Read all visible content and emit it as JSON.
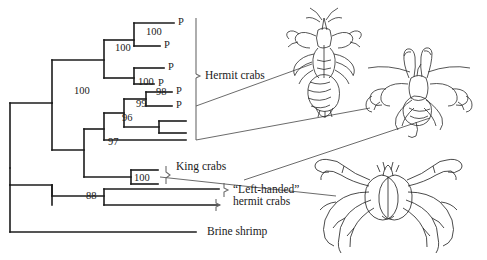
{
  "figure": {
    "type": "phylogenetic-tree",
    "title": ""
  },
  "tree": {
    "bootstrap_values": [
      {
        "id": "b-root-100",
        "value": "100",
        "x": 74,
        "y": 91
      },
      {
        "id": "b-clade-100a",
        "value": "100",
        "x": 115,
        "y": 48
      },
      {
        "id": "b-clade-100b",
        "value": "100",
        "x": 146,
        "y": 32
      },
      {
        "id": "b-clade-100c",
        "value": "100",
        "x": 140,
        "y": 82
      },
      {
        "id": "b-clade-98",
        "value": "98",
        "x": 156,
        "y": 95
      },
      {
        "id": "b-clade-99",
        "value": "99",
        "x": 139,
        "y": 104
      },
      {
        "id": "b-clade-96",
        "value": "96",
        "x": 124,
        "y": 118
      },
      {
        "id": "b-clade-97",
        "value": "97",
        "x": 110,
        "y": 141
      },
      {
        "id": "b-clade-100d",
        "value": "100",
        "x": 137,
        "y": 177
      },
      {
        "id": "b-clade-88",
        "value": "88",
        "x": 88,
        "y": 196
      }
    ],
    "tips": [
      {
        "id": "tip-p-1",
        "label": "P",
        "x": 182,
        "y": 22
      },
      {
        "id": "tip-p-2",
        "label": "P",
        "x": 176,
        "y": 44
      },
      {
        "id": "tip-p-3",
        "label": "P",
        "x": 172,
        "y": 66
      },
      {
        "id": "tip-p-4",
        "label": "P",
        "x": 162,
        "y": 82
      },
      {
        "id": "tip-p-5",
        "label": "P",
        "x": 180,
        "y": 91
      },
      {
        "id": "tip-p-6",
        "label": "P",
        "x": 180,
        "y": 106
      }
    ],
    "clade_labels": [
      {
        "id": "clade-hermit-crabs",
        "lines": [
          "Hermit crabs"
        ],
        "x": 205,
        "y": 75
      },
      {
        "id": "clade-king-crabs",
        "lines": [
          "King crabs"
        ],
        "x": 181,
        "y": 166
      },
      {
        "id": "clade-left-handed-hermit-crabs",
        "lines": [
          "“Left-handed”",
          "hermit crabs"
        ],
        "x": 228,
        "y": 192
      },
      {
        "id": "clade-brine-shrimp",
        "lines": [
          "Brine shrimp"
        ],
        "x": 213,
        "y": 232
      }
    ],
    "illustrations": [
      {
        "id": "illustration-hermit-crab-top",
        "name": "hermit-crab-drawing"
      },
      {
        "id": "illustration-hermit-crab-right",
        "name": "hermit-crab-in-shell-drawing"
      },
      {
        "id": "illustration-king-crab",
        "name": "king-crab-drawing"
      }
    ]
  },
  "colors": {
    "line": "#1c1c1c",
    "text": "#1a1a1a",
    "background": "#ffffff",
    "leader": "#555555"
  }
}
